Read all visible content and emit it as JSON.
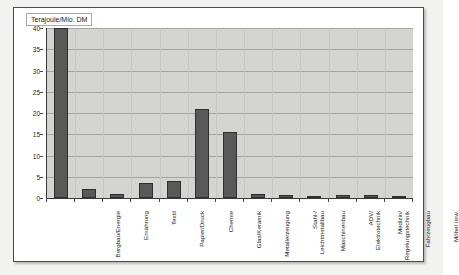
{
  "legend": {
    "unit_label": "Terajoule/Mio. DM"
  },
  "chart_data": {
    "type": "bar",
    "title": "",
    "subtitle": "",
    "xlabel": "",
    "ylabel": "Terajoule/Mio. DM",
    "ylim": [
      0,
      40
    ],
    "ytick_step": 5,
    "ytick_labels": [
      "40",
      "35",
      "30",
      "25",
      "20",
      "15",
      "10",
      "5",
      "0"
    ],
    "ytick_values": [
      40,
      35,
      30,
      25,
      20,
      15,
      10,
      5,
      0
    ],
    "grid": true,
    "legend_position": "top-left",
    "series_name": "Terajoule/Mio. DM",
    "bar_color": "#595959",
    "plot_background": "#d4d4d0",
    "categories": [
      "Bergbau/Energie",
      "Ernährung",
      "Textil",
      "Papier/Druck",
      "Chemie",
      "Glas/Keramik",
      "Metallerzeugung",
      "Stahl-/\nLeichtmetallbau",
      "Maschinenbau",
      "ADV/\nElektrotechnik",
      "Medizin/\nRegelungstechnik",
      "Fahrzeugbau",
      "Möbel usw."
    ],
    "values": [
      40,
      2.1,
      0.9,
      3.5,
      3.9,
      21,
      15.5,
      0.9,
      0.8,
      0.5,
      0.8,
      0.8,
      0.4
    ]
  }
}
